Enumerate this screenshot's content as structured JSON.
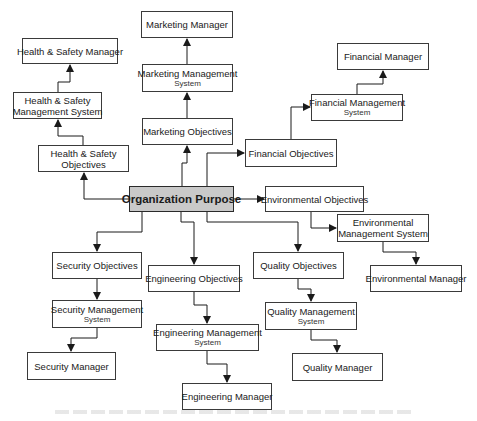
{
  "diagram": {
    "type": "flowchart",
    "colors": {
      "border": "#3a3a3a",
      "center_fill": "#c9c9c9",
      "node_fill": "#ffffff",
      "wire": "#1a1a1a"
    },
    "nodes": [
      {
        "id": "org",
        "label": [
          "Organization Purpose"
        ],
        "sub": "",
        "x": 129,
        "y": 186,
        "w": 105,
        "h": 26,
        "center": true
      },
      {
        "id": "mkt_obj",
        "label": [
          "Marketing Objectives"
        ],
        "sub": "",
        "x": 142,
        "y": 118,
        "w": 91,
        "h": 27
      },
      {
        "id": "mkt_sys",
        "label": [
          "Marketing Management"
        ],
        "sub": "System",
        "x": 142,
        "y": 64,
        "w": 91,
        "h": 28
      },
      {
        "id": "mkt_mgr",
        "label": [
          "Marketing Manager"
        ],
        "sub": "",
        "x": 141,
        "y": 11,
        "w": 92,
        "h": 27
      },
      {
        "id": "hs_obj",
        "label": [
          "Health & Safety",
          "Objectives"
        ],
        "sub": "",
        "x": 38,
        "y": 145,
        "w": 91,
        "h": 27
      },
      {
        "id": "hs_sys",
        "label": [
          "Health & Safety",
          "Management System"
        ],
        "sub": "",
        "x": 13,
        "y": 92,
        "w": 89,
        "h": 27
      },
      {
        "id": "hs_mgr",
        "label": [
          "Health & Safety Manager"
        ],
        "sub": "",
        "x": 22,
        "y": 38,
        "w": 96,
        "h": 26
      },
      {
        "id": "fin_obj",
        "label": [
          "Financial Objectives"
        ],
        "sub": "",
        "x": 245,
        "y": 139,
        "w": 92,
        "h": 28
      },
      {
        "id": "fin_sys",
        "label": [
          "Financial Management"
        ],
        "sub": "System",
        "x": 311,
        "y": 94,
        "w": 92,
        "h": 27
      },
      {
        "id": "fin_mgr",
        "label": [
          "Financial Manager"
        ],
        "sub": "",
        "x": 337,
        "y": 43,
        "w": 92,
        "h": 27
      },
      {
        "id": "env_obj",
        "label": [
          "Environmental Objectives"
        ],
        "sub": "",
        "x": 265,
        "y": 186,
        "w": 99,
        "h": 26
      },
      {
        "id": "env_sys",
        "label": [
          "Environmental",
          "Management System"
        ],
        "sub": "",
        "x": 337,
        "y": 214,
        "w": 92,
        "h": 28
      },
      {
        "id": "env_mgr",
        "label": [
          "Environmental Manager"
        ],
        "sub": "",
        "x": 370,
        "y": 265,
        "w": 92,
        "h": 27
      },
      {
        "id": "sec_obj",
        "label": [
          "Security Objectives"
        ],
        "sub": "",
        "x": 52,
        "y": 252,
        "w": 90,
        "h": 27
      },
      {
        "id": "sec_sys",
        "label": [
          "Security Management"
        ],
        "sub": "System",
        "x": 52,
        "y": 300,
        "w": 90,
        "h": 28
      },
      {
        "id": "sec_mgr",
        "label": [
          "Security Manager"
        ],
        "sub": "",
        "x": 27,
        "y": 352,
        "w": 89,
        "h": 28
      },
      {
        "id": "eng_obj",
        "label": [
          "Engineering Objectives"
        ],
        "sub": "",
        "x": 148,
        "y": 265,
        "w": 92,
        "h": 27
      },
      {
        "id": "eng_sys",
        "label": [
          "Engineering Management"
        ],
        "sub": "System",
        "x": 156,
        "y": 324,
        "w": 103,
        "h": 27
      },
      {
        "id": "eng_mgr",
        "label": [
          "Engineering Manager"
        ],
        "sub": "",
        "x": 182,
        "y": 383,
        "w": 90,
        "h": 27
      },
      {
        "id": "qual_obj",
        "label": [
          "Quality Objectives"
        ],
        "sub": "",
        "x": 253,
        "y": 252,
        "w": 91,
        "h": 27
      },
      {
        "id": "qual_sys",
        "label": [
          "Quality Management"
        ],
        "sub": "System",
        "x": 265,
        "y": 302,
        "w": 92,
        "h": 28
      },
      {
        "id": "qual_mgr",
        "label": [
          "Quality Manager"
        ],
        "sub": "",
        "x": 292,
        "y": 353,
        "w": 91,
        "h": 28
      }
    ],
    "edges": [
      {
        "from": "org",
        "to": "mkt_obj",
        "points": [
          [
            182,
            186
          ],
          [
            182,
            163
          ],
          [
            187,
            163
          ],
          [
            187,
            146
          ]
        ]
      },
      {
        "from": "mkt_obj",
        "to": "mkt_sys",
        "points": [
          [
            187,
            118
          ],
          [
            187,
            93
          ]
        ]
      },
      {
        "from": "mkt_sys",
        "to": "mkt_mgr",
        "points": [
          [
            187,
            64
          ],
          [
            187,
            39
          ]
        ]
      },
      {
        "from": "org",
        "to": "hs_obj",
        "points": [
          [
            129,
            199
          ],
          [
            84,
            199
          ],
          [
            84,
            173
          ]
        ]
      },
      {
        "from": "hs_obj",
        "to": "hs_sys",
        "points": [
          [
            83,
            145
          ],
          [
            83,
            136
          ],
          [
            58,
            136
          ],
          [
            58,
            120
          ]
        ]
      },
      {
        "from": "hs_sys",
        "to": "hs_mgr",
        "points": [
          [
            58,
            92
          ],
          [
            58,
            82
          ],
          [
            70,
            82
          ],
          [
            70,
            65
          ]
        ]
      },
      {
        "from": "org",
        "to": "fin_obj",
        "points": [
          [
            207,
            186
          ],
          [
            207,
            153
          ],
          [
            244,
            153
          ]
        ]
      },
      {
        "from": "fin_obj",
        "to": "fin_sys",
        "points": [
          [
            291,
            139
          ],
          [
            291,
            107
          ],
          [
            310,
            107
          ]
        ]
      },
      {
        "from": "fin_sys",
        "to": "fin_mgr",
        "points": [
          [
            357,
            94
          ],
          [
            357,
            84
          ],
          [
            383,
            84
          ],
          [
            383,
            71
          ]
        ]
      },
      {
        "from": "org",
        "to": "env_obj",
        "points": [
          [
            234,
            199
          ],
          [
            264,
            199
          ]
        ]
      },
      {
        "from": "env_obj",
        "to": "env_sys",
        "points": [
          [
            311,
            212
          ],
          [
            311,
            228
          ],
          [
            336,
            228
          ]
        ]
      },
      {
        "from": "env_sys",
        "to": "env_mgr",
        "points": [
          [
            383,
            242
          ],
          [
            383,
            252
          ],
          [
            416,
            252
          ],
          [
            416,
            264
          ]
        ]
      },
      {
        "from": "org",
        "to": "sec_obj",
        "points": [
          [
            142,
            212
          ],
          [
            142,
            232
          ],
          [
            97,
            232
          ],
          [
            97,
            251
          ]
        ]
      },
      {
        "from": "sec_obj",
        "to": "sec_sys",
        "points": [
          [
            97,
            279
          ],
          [
            97,
            299
          ]
        ]
      },
      {
        "from": "sec_sys",
        "to": "sec_mgr",
        "points": [
          [
            97,
            328
          ],
          [
            97,
            338
          ],
          [
            71,
            338
          ],
          [
            71,
            351
          ]
        ]
      },
      {
        "from": "org",
        "to": "eng_obj",
        "points": [
          [
            181,
            212
          ],
          [
            181,
            222
          ],
          [
            194,
            222
          ],
          [
            194,
            264
          ]
        ]
      },
      {
        "from": "eng_obj",
        "to": "eng_sys",
        "points": [
          [
            194,
            292
          ],
          [
            194,
            305
          ],
          [
            207,
            305
          ],
          [
            207,
            323
          ]
        ]
      },
      {
        "from": "eng_sys",
        "to": "eng_mgr",
        "points": [
          [
            207,
            351
          ],
          [
            207,
            364
          ],
          [
            227,
            364
          ],
          [
            227,
            382
          ]
        ]
      },
      {
        "from": "org",
        "to": "qual_obj",
        "points": [
          [
            207,
            212
          ],
          [
            207,
            222
          ],
          [
            298,
            222
          ],
          [
            298,
            251
          ]
        ]
      },
      {
        "from": "qual_obj",
        "to": "qual_sys",
        "points": [
          [
            298,
            279
          ],
          [
            298,
            289
          ],
          [
            311,
            289
          ],
          [
            311,
            301
          ]
        ]
      },
      {
        "from": "qual_sys",
        "to": "qual_mgr",
        "points": [
          [
            311,
            330
          ],
          [
            311,
            340
          ],
          [
            337,
            340
          ],
          [
            337,
            352
          ]
        ]
      }
    ]
  }
}
